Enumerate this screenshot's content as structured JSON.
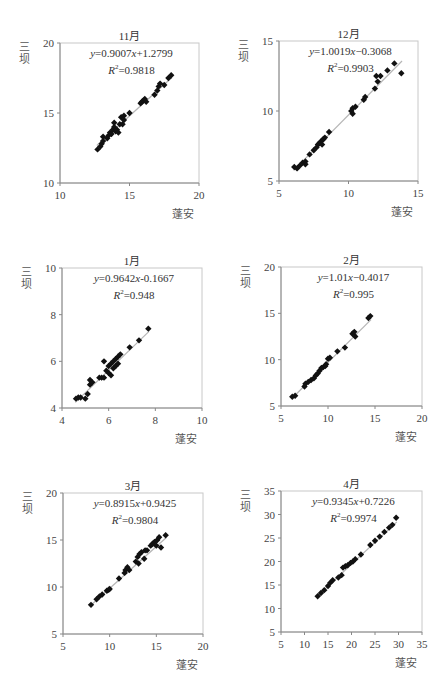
{
  "chart_data": [
    {
      "type": "scatter",
      "title": "11月",
      "xlabel": "蓬安",
      "ylabel": "三坝",
      "xlim": [
        10,
        20
      ],
      "ylim": [
        10,
        20
      ],
      "xticks": [
        10,
        15,
        20
      ],
      "yticks": [
        10,
        15,
        20
      ],
      "equation": "y=0.9007x+1.2799",
      "r2": "R²=0.9818",
      "trendline": {
        "slope": 0.9007,
        "intercept": 1.2799
      },
      "grid": false,
      "box": {
        "left": 60,
        "top": 43,
        "right": 199,
        "bottom": 183
      },
      "points": [
        [
          12.7,
          12.4
        ],
        [
          12.9,
          12.6
        ],
        [
          13.0,
          12.8
        ],
        [
          13.1,
          13.0
        ],
        [
          13.1,
          13.3
        ],
        [
          13.4,
          13.2
        ],
        [
          13.5,
          13.4
        ],
        [
          13.6,
          13.6
        ],
        [
          13.7,
          13.5
        ],
        [
          13.8,
          13.8
        ],
        [
          13.9,
          14.0
        ],
        [
          13.9,
          14.3
        ],
        [
          14.0,
          13.7
        ],
        [
          14.1,
          13.8
        ],
        [
          14.2,
          13.6
        ],
        [
          14.3,
          14.2
        ],
        [
          14.4,
          14.7
        ],
        [
          14.5,
          14.2
        ],
        [
          14.6,
          14.8
        ],
        [
          14.6,
          14.5
        ],
        [
          15.0,
          15.0
        ],
        [
          15.8,
          15.7
        ],
        [
          15.9,
          15.8
        ],
        [
          16.0,
          15.9
        ],
        [
          16.1,
          16.0
        ],
        [
          16.2,
          15.8
        ],
        [
          16.8,
          16.3
        ],
        [
          17.0,
          16.6
        ],
        [
          17.1,
          16.9
        ],
        [
          17.2,
          17.1
        ],
        [
          17.5,
          17.0
        ],
        [
          17.8,
          17.5
        ],
        [
          18.0,
          17.7
        ]
      ]
    },
    {
      "type": "scatter",
      "title": "12月",
      "xlabel": "蓬安",
      "ylabel": "三坝",
      "xlim": [
        5,
        15
      ],
      "ylim": [
        5,
        15
      ],
      "xticks": [
        5,
        10,
        15
      ],
      "yticks": [
        5,
        10,
        15
      ],
      "equation": "y=1.0019x−0.3068",
      "r2": "R²=0.9903",
      "trendline": {
        "slope": 1.0019,
        "intercept": -0.3068
      },
      "grid": false,
      "box": {
        "left": 279,
        "top": 41,
        "right": 418,
        "bottom": 181
      },
      "points": [
        [
          6.1,
          6.0
        ],
        [
          6.3,
          5.9
        ],
        [
          6.5,
          6.1
        ],
        [
          6.7,
          6.3
        ],
        [
          6.9,
          6.4
        ],
        [
          6.9,
          6.2
        ],
        [
          7.2,
          6.9
        ],
        [
          7.5,
          7.2
        ],
        [
          7.7,
          7.4
        ],
        [
          7.8,
          7.6
        ],
        [
          7.9,
          7.7
        ],
        [
          8.0,
          7.8
        ],
        [
          8.1,
          7.9
        ],
        [
          8.1,
          7.6
        ],
        [
          8.2,
          8.0
        ],
        [
          8.3,
          8.1
        ],
        [
          8.6,
          8.5
        ],
        [
          10.2,
          10.0
        ],
        [
          10.3,
          10.2
        ],
        [
          10.3,
          9.8
        ],
        [
          10.5,
          10.3
        ],
        [
          11.1,
          10.8
        ],
        [
          11.2,
          11.0
        ],
        [
          11.9,
          11.6
        ],
        [
          12.0,
          12.5
        ],
        [
          12.1,
          12.1
        ],
        [
          12.3,
          12.5
        ],
        [
          12.8,
          12.9
        ],
        [
          13.3,
          13.4
        ],
        [
          13.8,
          12.7
        ]
      ]
    },
    {
      "type": "scatter",
      "title": "1月",
      "xlabel": "蓬安",
      "ylabel": "三坝",
      "xlim": [
        4,
        10
      ],
      "ylim": [
        4,
        10
      ],
      "xticks": [
        4,
        6,
        8,
        10
      ],
      "yticks": [
        4,
        6,
        8,
        10
      ],
      "equation": "y=0.9642x-0.1667",
      "r2": "R²=0.948",
      "trendline": {
        "slope": 0.9642,
        "intercept": -0.1667
      },
      "grid": false,
      "box": {
        "left": 62,
        "top": 268,
        "right": 202,
        "bottom": 408
      },
      "points": [
        [
          4.6,
          4.4
        ],
        [
          4.7,
          4.45
        ],
        [
          4.8,
          4.45
        ],
        [
          5.0,
          4.4
        ],
        [
          5.1,
          4.6
        ],
        [
          5.2,
          5.0
        ],
        [
          5.2,
          5.2
        ],
        [
          5.3,
          5.1
        ],
        [
          5.6,
          5.3
        ],
        [
          5.7,
          5.3
        ],
        [
          5.8,
          5.3
        ],
        [
          5.8,
          6.0
        ],
        [
          5.9,
          5.6
        ],
        [
          6.0,
          5.5
        ],
        [
          6.0,
          5.8
        ],
        [
          6.1,
          5.9
        ],
        [
          6.1,
          5.4
        ],
        [
          6.2,
          5.7
        ],
        [
          6.2,
          6.0
        ],
        [
          6.3,
          5.8
        ],
        [
          6.3,
          6.1
        ],
        [
          6.4,
          6.2
        ],
        [
          6.4,
          5.9
        ],
        [
          6.5,
          6.3
        ],
        [
          6.9,
          6.6
        ],
        [
          7.3,
          6.9
        ],
        [
          7.7,
          7.4
        ]
      ]
    },
    {
      "type": "scatter",
      "title": "2月",
      "xlabel": "蓬安",
      "ylabel": "三坝",
      "xlim": [
        5,
        20
      ],
      "ylim": [
        5,
        20
      ],
      "xticks": [
        5,
        10,
        15,
        20
      ],
      "yticks": [
        5,
        10,
        15,
        20
      ],
      "equation": "y=1.01x−0.4017",
      "r2": "R²=0.995",
      "trendline": {
        "slope": 1.01,
        "intercept": -0.4017
      },
      "grid": false,
      "box": {
        "left": 281,
        "top": 267,
        "right": 422,
        "bottom": 406
      },
      "points": [
        [
          6.2,
          6.0
        ],
        [
          6.5,
          6.1
        ],
        [
          7.5,
          7.1
        ],
        [
          7.6,
          7.4
        ],
        [
          7.9,
          7.6
        ],
        [
          8.2,
          7.8
        ],
        [
          8.5,
          8.0
        ],
        [
          8.7,
          8.3
        ],
        [
          8.9,
          8.5
        ],
        [
          9.1,
          8.8
        ],
        [
          9.3,
          9.1
        ],
        [
          9.5,
          9.2
        ],
        [
          9.7,
          9.3
        ],
        [
          9.8,
          9.5
        ],
        [
          10.0,
          10.1
        ],
        [
          10.2,
          10.2
        ],
        [
          11.0,
          10.9
        ],
        [
          11.8,
          11.3
        ],
        [
          12.6,
          12.8
        ],
        [
          12.8,
          13.0
        ],
        [
          12.9,
          12.5
        ],
        [
          14.3,
          14.5
        ],
        [
          14.5,
          14.7
        ]
      ]
    },
    {
      "type": "scatter",
      "title": "3月",
      "xlabel": "蓬安",
      "ylabel": "三坝",
      "xlim": [
        5,
        20
      ],
      "ylim": [
        5,
        20
      ],
      "xticks": [
        5,
        10,
        15,
        20
      ],
      "yticks": [
        5,
        10,
        15,
        20
      ],
      "equation": "y=0.8915x+0.9425",
      "r2": "R²=0.9804",
      "trendline": {
        "slope": 0.8915,
        "intercept": 0.9425
      },
      "grid": false,
      "box": {
        "left": 63,
        "top": 493,
        "right": 203,
        "bottom": 634
      },
      "points": [
        [
          8.0,
          8.1
        ],
        [
          8.6,
          8.7
        ],
        [
          8.9,
          9.0
        ],
        [
          9.2,
          9.2
        ],
        [
          9.7,
          9.6
        ],
        [
          9.9,
          9.7
        ],
        [
          10.0,
          9.8
        ],
        [
          11.0,
          10.9
        ],
        [
          11.6,
          11.5
        ],
        [
          11.7,
          11.8
        ],
        [
          11.9,
          12.1
        ],
        [
          12.1,
          11.8
        ],
        [
          12.8,
          12.7
        ],
        [
          13.0,
          13.2
        ],
        [
          13.1,
          12.5
        ],
        [
          13.2,
          13.5
        ],
        [
          13.4,
          13.7
        ],
        [
          13.7,
          13.0
        ],
        [
          13.8,
          13.9
        ],
        [
          14.0,
          13.9
        ],
        [
          14.4,
          14.4
        ],
        [
          14.6,
          14.6
        ],
        [
          14.8,
          14.8
        ],
        [
          15.0,
          14.4
        ],
        [
          15.1,
          15.0
        ],
        [
          15.3,
          15.3
        ],
        [
          15.5,
          14.2
        ],
        [
          16.0,
          15.5
        ]
      ]
    },
    {
      "type": "scatter",
      "title": "4月",
      "xlabel": "蓬安",
      "ylabel": "三坝",
      "xlim": [
        5,
        35
      ],
      "ylim": [
        5,
        35
      ],
      "xticks": [
        5,
        10,
        15,
        20,
        25,
        30,
        35
      ],
      "yticks": [
        5,
        10,
        15,
        20,
        25,
        30,
        35
      ],
      "equation": "y=0.9345x+0.7226",
      "r2": "R²=0.9974",
      "trendline": {
        "slope": 0.9345,
        "intercept": 0.7226
      },
      "grid": false,
      "box": {
        "left": 281,
        "top": 491,
        "right": 422,
        "bottom": 632
      },
      "points": [
        [
          12.8,
          12.6
        ],
        [
          13.5,
          13.3
        ],
        [
          14.2,
          13.9
        ],
        [
          15.0,
          14.8
        ],
        [
          15.5,
          15.5
        ],
        [
          16.0,
          16.0
        ],
        [
          17.2,
          16.6
        ],
        [
          17.9,
          17.1
        ],
        [
          18.2,
          18.7
        ],
        [
          18.7,
          19.0
        ],
        [
          19.2,
          19.2
        ],
        [
          19.8,
          19.7
        ],
        [
          20.3,
          20.0
        ],
        [
          20.8,
          20.5
        ],
        [
          22.0,
          21.5
        ],
        [
          24.0,
          23.5
        ],
        [
          25.0,
          24.4
        ],
        [
          26.0,
          25.3
        ],
        [
          27.0,
          26.3
        ],
        [
          28.0,
          27.2
        ],
        [
          28.7,
          27.8
        ],
        [
          29.5,
          29.3
        ]
      ]
    }
  ]
}
